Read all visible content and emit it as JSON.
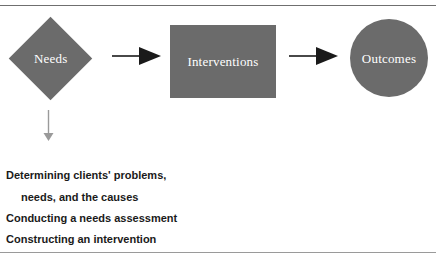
{
  "figure": {
    "background_color": "#ffffff",
    "rules": [
      {
        "name": "top-rule",
        "color": "#6f6f6f"
      },
      {
        "name": "bottom-rule",
        "color": "#9a9a9a"
      }
    ],
    "shape_fill_color": "#6b6b6b",
    "shape_label_color": "#ffffff",
    "arrow_color": "#1a1a1a",
    "down_arrow_color": "#9a9a9a",
    "text_color": "#1a1a1a"
  },
  "nodes": [
    {
      "id": "needs",
      "label": "Needs",
      "shape": "diamond"
    },
    {
      "id": "interventions",
      "label": "Interventions",
      "shape": "rectangle"
    },
    {
      "id": "outcomes",
      "label": "Outcomes",
      "shape": "circle"
    }
  ],
  "connectors": [
    {
      "id": "needs-to-interventions",
      "direction": "right"
    },
    {
      "id": "interventions-to-outcomes",
      "direction": "right"
    },
    {
      "id": "needs-to-activities",
      "direction": "down"
    }
  ],
  "activities": [
    {
      "text": "Determining clients' problems,",
      "indented": false
    },
    {
      "text": "needs, and the causes",
      "indented": true
    },
    {
      "text": "Conducting a needs assessment",
      "indented": false
    },
    {
      "text": "Constructing an intervention",
      "indented": false
    }
  ]
}
